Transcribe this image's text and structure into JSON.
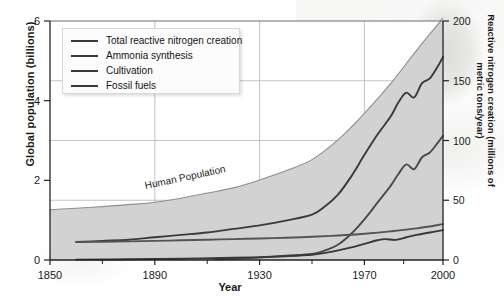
{
  "chart_data": {
    "type": "line",
    "title": "",
    "xlabel": "Year",
    "ylabel": "Global population (billions)",
    "ylabel_right": "Reactive nitrogen creation (millions of metric tons/year)",
    "xlim": [
      1850,
      2000
    ],
    "ylim": [
      0,
      6
    ],
    "ylim_right": [
      0,
      200
    ],
    "xticks": [
      1850,
      1890,
      1930,
      1970,
      2000
    ],
    "xtick_labels": [
      "1850",
      "1890",
      "1930",
      "1970",
      "2000"
    ],
    "yticks_left": [
      0,
      2,
      4,
      6
    ],
    "ytick_labels_left": [
      "0",
      "2",
      "4",
      "6"
    ],
    "yticks_right": [
      0,
      50,
      100,
      150,
      200
    ],
    "ytick_labels_right": [
      "0",
      "50",
      "100",
      "150",
      "200"
    ],
    "grid": true,
    "legend_position": "upper-left",
    "annotations": [
      {
        "text": "Human Population",
        "x": 1905,
        "y": 1.75
      }
    ],
    "area_series": {
      "name": "Human Population",
      "fill": "#d2d2d2",
      "axis": "left",
      "x": [
        1850,
        1860,
        1870,
        1880,
        1890,
        1900,
        1910,
        1920,
        1930,
        1940,
        1950,
        1960,
        1970,
        1980,
        1990,
        2000
      ],
      "values": [
        1.26,
        1.3,
        1.34,
        1.39,
        1.45,
        1.55,
        1.68,
        1.81,
        2.01,
        2.24,
        2.52,
        3.02,
        3.68,
        4.43,
        5.27,
        6.07
      ]
    },
    "series": [
      {
        "name": "Total reactive nitrogen creation",
        "color": "#3a3a3a",
        "axis": "right",
        "units": "millions of metric tons/year",
        "x": [
          1860,
          1870,
          1880,
          1890,
          1900,
          1910,
          1920,
          1930,
          1940,
          1950,
          1955,
          1960,
          1965,
          1970,
          1975,
          1980,
          1983,
          1986,
          1989,
          1992,
          1995,
          1998,
          2000
        ],
        "values": [
          15,
          16,
          17,
          19,
          21,
          23,
          26,
          29,
          33,
          38,
          45,
          55,
          70,
          88,
          105,
          120,
          132,
          140,
          136,
          148,
          152,
          162,
          170
        ]
      },
      {
        "name": "Ammonia synthesis",
        "color": "#4a4a4a",
        "axis": "right",
        "units": "millions of metric tons/year",
        "x": [
          1913,
          1920,
          1930,
          1940,
          1950,
          1955,
          1960,
          1965,
          1970,
          1975,
          1980,
          1983,
          1986,
          1989,
          1992,
          1995,
          1998,
          2000
        ],
        "values": [
          0.5,
          1.0,
          2.0,
          3.5,
          5.0,
          8.0,
          13,
          22,
          34,
          48,
          62,
          72,
          80,
          76,
          86,
          90,
          98,
          104
        ]
      },
      {
        "name": "Cultivation",
        "color": "#545454",
        "axis": "right",
        "units": "millions of metric tons/year",
        "x": [
          1860,
          1870,
          1880,
          1890,
          1900,
          1910,
          1920,
          1930,
          1940,
          1950,
          1960,
          1970,
          1980,
          1990,
          2000
        ],
        "values": [
          15,
          15.3,
          15.6,
          16,
          16.5,
          17,
          17.5,
          18,
          18.6,
          19.4,
          20.5,
          22,
          24,
          26.5,
          30
        ]
      },
      {
        "name": "Fossil fuels",
        "color": "#383838",
        "axis": "right",
        "units": "millions of metric tons/year",
        "x": [
          1860,
          1880,
          1900,
          1920,
          1930,
          1940,
          1950,
          1955,
          1960,
          1965,
          1970,
          1975,
          1978,
          1982,
          1986,
          1990,
          1995,
          2000
        ],
        "values": [
          0.3,
          0.6,
          1.1,
          1.9,
          2.4,
          3.2,
          4.4,
          6.0,
          8.0,
          10.5,
          13.5,
          16.5,
          17.5,
          16.8,
          19,
          21,
          23,
          25
        ]
      }
    ]
  },
  "legend": {
    "items": [
      {
        "label": "Total reactive nitrogen creation"
      },
      {
        "label": "Ammonia synthesis"
      },
      {
        "label": "Cultivation"
      },
      {
        "label": "Fossil fuels"
      }
    ]
  }
}
